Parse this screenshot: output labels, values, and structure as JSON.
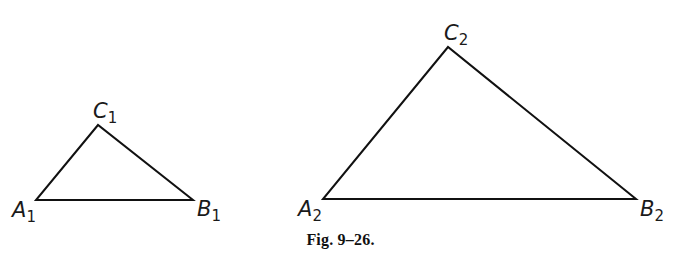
{
  "figure": {
    "caption": "Fig. 9–26.",
    "stroke_color": "#111111",
    "background": "#ffffff",
    "triangles": [
      {
        "id": "triangle-1",
        "vertices": {
          "A": {
            "label": "A",
            "subscript": "1",
            "x": 36,
            "y": 200
          },
          "B": {
            "label": "B",
            "subscript": "1",
            "x": 193,
            "y": 200
          },
          "C": {
            "label": "C",
            "subscript": "1",
            "x": 98,
            "y": 125
          }
        }
      },
      {
        "id": "triangle-2",
        "vertices": {
          "A": {
            "label": "A",
            "subscript": "2",
            "x": 323,
            "y": 199
          },
          "B": {
            "label": "B",
            "subscript": "2",
            "x": 636,
            "y": 199
          },
          "C": {
            "label": "C",
            "subscript": "2",
            "x": 448,
            "y": 47
          }
        }
      }
    ]
  }
}
